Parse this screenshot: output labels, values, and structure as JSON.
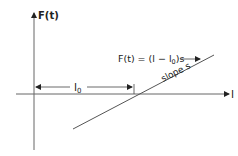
{
  "diagram": {
    "y_axis_label": "F(t)",
    "x_axis_label": "l",
    "offset_label_base": "l",
    "offset_label_sub": "0",
    "equation_prefix": "F(t) = (l − l",
    "equation_sub": "0",
    "equation_suffix": ")s",
    "equation_arrow": "→",
    "slope_label": "slope s",
    "colors": {
      "ink": "#222222",
      "axis": "#555555",
      "background": "#ffffff"
    }
  }
}
